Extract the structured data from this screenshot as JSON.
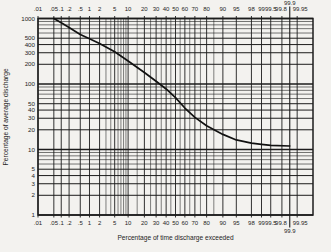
{
  "colors": {
    "paper": "#f3f2ef",
    "ink": "#1c1c1c",
    "curve": "#111111",
    "text": "#242424"
  },
  "chart_data": {
    "type": "line",
    "xlabel": "Percentage of time discharge exceeded",
    "ylabel": "Percentage of average discharge",
    "x_scale": "normal-probability",
    "y_scale": "log",
    "xlim": [
      0.01,
      99.99
    ],
    "ylim": [
      1,
      1000
    ],
    "grid": "on",
    "x_ticks": [
      {
        "v": 0.01,
        "label": ".01"
      },
      {
        "v": 0.05,
        "label": ".05"
      },
      {
        "v": 0.1,
        "label": ".1"
      },
      {
        "v": 0.2,
        "label": ".2"
      },
      {
        "v": 0.5,
        "label": ".5"
      },
      {
        "v": 1,
        "label": "1"
      },
      {
        "v": 2,
        "label": "2"
      },
      {
        "v": 5,
        "label": "5"
      },
      {
        "v": 10,
        "label": "10"
      },
      {
        "v": 20,
        "label": "20"
      },
      {
        "v": 30,
        "label": "30"
      },
      {
        "v": 40,
        "label": "40"
      },
      {
        "v": 50,
        "label": "50"
      },
      {
        "v": 60,
        "label": "60"
      },
      {
        "v": 70,
        "label": "70"
      },
      {
        "v": 80,
        "label": "80"
      },
      {
        "v": 90,
        "label": "90"
      },
      {
        "v": 95,
        "label": "95"
      },
      {
        "v": 98,
        "label": "98"
      },
      {
        "v": 99,
        "label": "99"
      },
      {
        "v": 99.5,
        "label": "99.5"
      },
      {
        "v": 99.8,
        "label": "99.8",
        "dx": -1
      },
      {
        "v": 99.9,
        "label": "99.9",
        "offset_row": true,
        "long_line": true
      },
      {
        "v": 99.95,
        "label": "99.95",
        "dx": 3
      }
    ],
    "x_minor_ticks": [
      3,
      4,
      6,
      7,
      8,
      9,
      15,
      25,
      35,
      45,
      55,
      65,
      75,
      85
    ],
    "y_ticks": [
      {
        "v": 1000,
        "label": "1000"
      },
      {
        "v": 500,
        "label": "500"
      },
      {
        "v": 400,
        "label": "400"
      },
      {
        "v": 300,
        "label": "300"
      },
      {
        "v": 200,
        "label": "200"
      },
      {
        "v": 100,
        "label": "100"
      },
      {
        "v": 50,
        "label": "50"
      },
      {
        "v": 40,
        "label": "40"
      },
      {
        "v": 30,
        "label": "30"
      },
      {
        "v": 20,
        "label": "20"
      },
      {
        "v": 10,
        "label": "10"
      },
      {
        "v": 5,
        "label": "5"
      },
      {
        "v": 4,
        "label": "4"
      },
      {
        "v": 3,
        "label": "3"
      },
      {
        "v": 2,
        "label": "2"
      },
      {
        "v": 1,
        "label": "1"
      }
    ],
    "series": [
      {
        "name": "flow-duration-curve",
        "x": [
          0.05,
          0.1,
          0.2,
          0.5,
          1,
          2,
          5,
          10,
          20,
          30,
          40,
          50,
          60,
          70,
          80,
          90,
          95,
          98,
          99,
          99.5,
          99.9
        ],
        "y": [
          1000,
          860,
          730,
          570,
          490,
          415,
          310,
          225,
          150,
          110,
          84,
          62,
          43,
          31,
          23,
          17,
          14,
          12.5,
          12,
          11.6,
          11.3
        ]
      }
    ]
  }
}
